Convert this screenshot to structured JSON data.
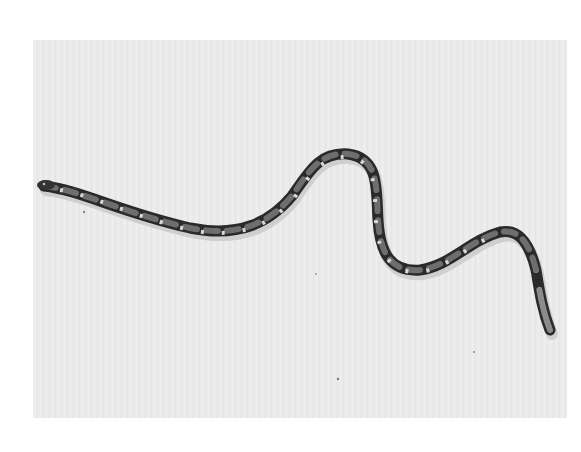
{
  "image": {
    "subject": "snake",
    "description": "Black-and-white photograph of a patterned snake stretched in an S-curve across a pale background",
    "colors": {
      "page_background": "#ffffff",
      "photo_background": "#ebebeb",
      "snake_dark": "#2a2a2a",
      "snake_saddle": "#6e6e6e",
      "snake_light_marks": "#d8d8d8"
    },
    "photo_frame": {
      "x": 33,
      "y": 40,
      "width": 534,
      "height": 378
    }
  }
}
